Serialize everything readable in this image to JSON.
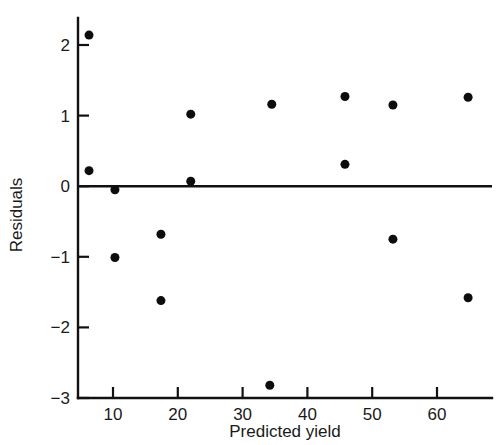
{
  "chart_data": {
    "type": "scatter",
    "title": "",
    "xlabel": "Predicted yield",
    "ylabel": "Residuals",
    "xlim": [
      3,
      68
    ],
    "ylim": [
      -3,
      2.35
    ],
    "grid": false,
    "legend": "none",
    "xticks": [
      10,
      20,
      30,
      40,
      50,
      60
    ],
    "xtick_labels": [
      "10",
      "20",
      "30",
      "40",
      "50",
      "60"
    ],
    "yticks": [
      2,
      1,
      0,
      -1,
      -2,
      -3
    ],
    "ytick_labels": [
      "2",
      "1",
      "0",
      "−1",
      "−2",
      "−3"
    ],
    "reference_line": {
      "orientation": "horizontal",
      "y": 0
    },
    "marker": {
      "shape": "circle",
      "color": "#0d0d0d",
      "size": 9
    },
    "points": [
      {
        "x": 6.3,
        "y": 2.14
      },
      {
        "x": 6.3,
        "y": 0.22
      },
      {
        "x": 10.3,
        "y": -0.05
      },
      {
        "x": 10.3,
        "y": -1.01
      },
      {
        "x": 17.4,
        "y": -0.68
      },
      {
        "x": 17.4,
        "y": -1.62
      },
      {
        "x": 22.0,
        "y": 1.02
      },
      {
        "x": 22.0,
        "y": 0.07
      },
      {
        "x": 34.5,
        "y": 1.16
      },
      {
        "x": 34.2,
        "y": -2.82
      },
      {
        "x": 45.8,
        "y": 1.27
      },
      {
        "x": 45.8,
        "y": 0.31
      },
      {
        "x": 53.2,
        "y": 1.15
      },
      {
        "x": 53.2,
        "y": -0.75
      },
      {
        "x": 64.8,
        "y": 1.26
      },
      {
        "x": 64.8,
        "y": -1.58
      }
    ]
  }
}
